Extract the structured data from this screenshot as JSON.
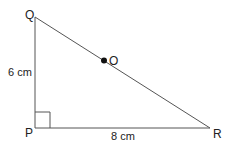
{
  "diagram": {
    "type": "right-triangle",
    "vertices": {
      "Q": {
        "label": "Q"
      },
      "P": {
        "label": "P"
      },
      "R": {
        "label": "R"
      }
    },
    "point": {
      "label": "O"
    },
    "sides": {
      "PQ": {
        "length_label": "6 cm"
      },
      "PR": {
        "length_label": "8 cm"
      }
    },
    "right_angle_at": "P",
    "colors": {
      "line": "#555555",
      "text": "#222222",
      "dot": "#111111"
    }
  }
}
